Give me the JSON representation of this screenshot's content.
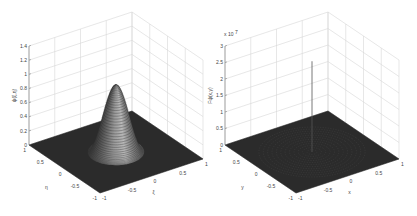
{
  "figure": {
    "background": "#ffffff",
    "grid_color": "#d6d6d6",
    "surface_color": "#2b2b2b",
    "spike_color": "#555555"
  },
  "chart_data": [
    {
      "type": "surface3d",
      "title": "",
      "description": "Smooth radially symmetric bump centered at origin on flat zero plane",
      "xlabel": "ξ",
      "ylabel": "η",
      "zlabel": "ψ ( ξ , η )",
      "xlim": [
        -1,
        1
      ],
      "ylim": [
        -1,
        1
      ],
      "zlim": [
        0,
        1.4
      ],
      "x_ticks": [
        "-1",
        "-0.5",
        "0",
        "0.5",
        "1"
      ],
      "y_ticks": [
        "-1",
        "-0.5",
        "0",
        "0.5",
        "1"
      ],
      "z_ticks": [
        "0",
        "0.2",
        "0.4",
        "0.6",
        "0.8",
        "1",
        "1.2",
        "1.4"
      ],
      "peak": {
        "x": 0,
        "y": 0,
        "z": 0.95
      },
      "support_radius": 0.45,
      "grid": true
    },
    {
      "type": "surface3d",
      "title": "",
      "description": "Near-zero oscillating surface with a single tall spike near origin",
      "xlabel": "x",
      "ylabel": "y",
      "zlabel": "Fψ ( x , y )",
      "z_multiplier": "x 10^7",
      "xlim": [
        -1,
        1
      ],
      "ylim": [
        -1,
        1
      ],
      "zlim": [
        0,
        3
      ],
      "x_ticks": [
        "-1",
        "-0.5",
        "0",
        "0.5",
        "1"
      ],
      "y_ticks": [
        "-1",
        "-0.5",
        "0",
        "0.5",
        "1"
      ],
      "z_ticks": [
        "0",
        "0.5",
        "1",
        "1.5",
        "2",
        "2.5",
        "3"
      ],
      "spike": {
        "x": 0,
        "y": 0,
        "z": 2.75
      },
      "grid": true
    }
  ],
  "labels": {
    "left": {
      "zlabel": "ψ(ξ,η)",
      "xlabel": "ξ",
      "ylabel": "η"
    },
    "right": {
      "zlabel": "Fψ(x,y)",
      "xlabel": "x",
      "ylabel": "y",
      "multiplier_base": "x 10",
      "multiplier_exp": "7"
    }
  }
}
